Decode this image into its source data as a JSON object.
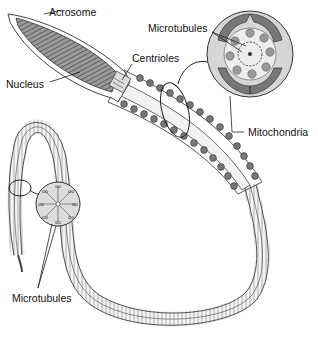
{
  "diagram": {
    "labels": {
      "acrosome": "Acrosome",
      "nucleus": "Nucleus",
      "centrioles": "Centrioles",
      "microtubules_top": "Microtubules",
      "mitochondria": "Mitochondria",
      "microtubules_bottom": "Microtubules"
    },
    "colors": {
      "stroke": "#333333",
      "fill_gray": "#8a8a8a",
      "fill_light": "#e6e6e6",
      "background": "#ffffff"
    }
  }
}
